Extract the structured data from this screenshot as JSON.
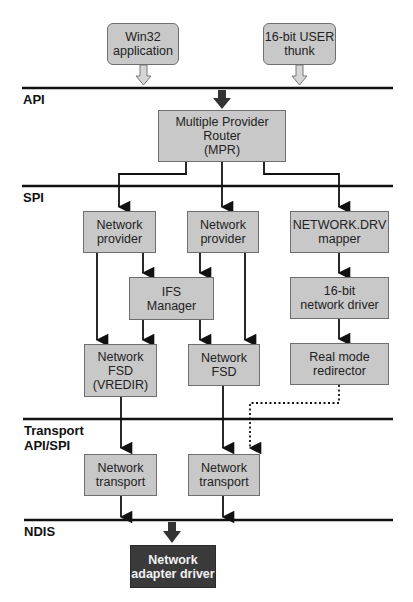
{
  "layers": {
    "api": "API",
    "spi": "SPI",
    "transport": "Transport\nAPI/SPI",
    "ndis": "NDIS"
  },
  "boxes": {
    "win32_app": "Win32\napplication",
    "user_thunk": "16-bit USER\nthunk",
    "mpr": "Multiple Provider Router\n(MPR)",
    "network_provider_1": "Network\nprovider",
    "network_provider_2": "Network\nprovider",
    "network_drv_mapper": "NETWORK.DRV\nmapper",
    "ifs_manager": "IFS\nManager",
    "network_driver_16bit": "16-bit\nnetwork driver",
    "network_fsd_vredir": "Network\nFSD\n(VREDIR)",
    "network_fsd": "Network\nFSD",
    "real_mode_redirector": "Real mode\nredirector",
    "network_transport_1": "Network\ntransport",
    "network_transport_2": "Network\ntransport",
    "network_adapter_driver": "Network\nadapter driver"
  },
  "colors": {
    "box_fill": "#c8c8c8",
    "box_border": "#6e6e6e",
    "dark_box_fill": "#3a3a3a",
    "line": "#111111"
  }
}
